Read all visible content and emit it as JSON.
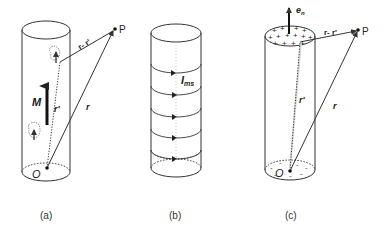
{
  "figure": {
    "panels": [
      {
        "id": "a",
        "caption": "(a)",
        "labels": {
          "magnetization": "M",
          "r_prime": "r'",
          "r": "r",
          "r_minus_r_prime": "r- r'",
          "point": "P",
          "origin": "O"
        }
      },
      {
        "id": "b",
        "caption": "(b)",
        "labels": {
          "current": "I",
          "current_sub": "ms"
        }
      },
      {
        "id": "c",
        "caption": "(c)",
        "labels": {
          "normal": "e",
          "normal_sub": "n",
          "r_prime": "r'",
          "r": "r",
          "r_minus_r_prime": "r- r'",
          "point": "P",
          "origin": "O",
          "top_charge": "+",
          "bottom_charge": "-"
        }
      }
    ],
    "colors": {
      "line": "#333333",
      "background": "#ffffff"
    }
  }
}
